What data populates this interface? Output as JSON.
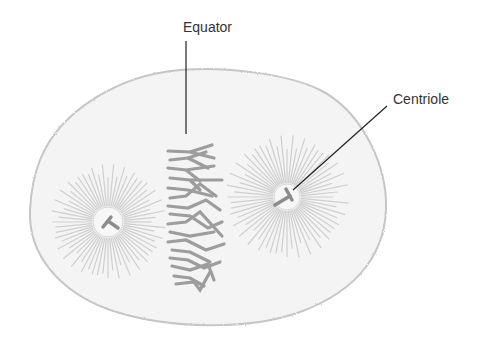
{
  "figure": {
    "labels": {
      "equator": "Equator",
      "centriole": "Centriole"
    },
    "colors": {
      "background": "#ffffff",
      "cell_fill": "#f4f4f4",
      "cell_outline": "#c9c9c9",
      "chromosomes": "#9a9a9a",
      "spindle_fibers": "#c8c8c8",
      "centriole": "#8c8c8c",
      "leader_lines": "#222222",
      "label_text": "#333333"
    },
    "structures": [
      {
        "name": "cell",
        "shape": "irregular oval"
      },
      {
        "name": "left-centriole",
        "position": [
          108,
          222
        ]
      },
      {
        "name": "right-centriole",
        "position": [
          287,
          197
        ]
      },
      {
        "name": "metaphase-plate-chromosomes",
        "position": [
          195,
          215
        ]
      },
      {
        "name": "left-aster-spindle"
      },
      {
        "name": "right-aster-spindle"
      }
    ]
  }
}
